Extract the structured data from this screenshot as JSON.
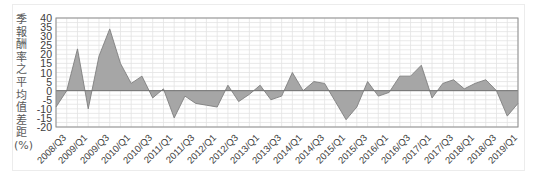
{
  "chart_data": {
    "type": "area",
    "title": "",
    "xlabel": "",
    "ylabel": "季報酬率之平均值 差距(%)",
    "ylim": [
      -20,
      40
    ],
    "yticks": [
      40,
      35,
      30,
      25,
      20,
      15,
      10,
      5,
      0,
      -5,
      -10,
      -15,
      -20
    ],
    "grid": true,
    "legend": null,
    "x_tick_labels": [
      "2008/Q3",
      "2009/Q1",
      "2009/Q3",
      "2010/Q1",
      "2010/Q3",
      "2011/Q1",
      "2011/Q3",
      "2012/Q1",
      "2012/Q3",
      "2013/Q1",
      "2013/Q3",
      "2014/Q1",
      "2014/Q3",
      "2015/Q1",
      "2015/Q3",
      "2016/Q1",
      "2016/Q3",
      "2017/Q1",
      "2017/Q3",
      "2018/Q1",
      "2018/Q3",
      "2019/Q1"
    ],
    "categories": [
      "2008/Q3",
      "2008/Q4",
      "2009/Q1",
      "2009/Q2",
      "2009/Q3",
      "2009/Q4",
      "2010/Q1",
      "2010/Q2",
      "2010/Q3",
      "2010/Q4",
      "2011/Q1",
      "2011/Q2",
      "2011/Q3",
      "2011/Q4",
      "2012/Q1",
      "2012/Q2",
      "2012/Q3",
      "2012/Q4",
      "2013/Q1",
      "2013/Q2",
      "2013/Q3",
      "2013/Q4",
      "2014/Q1",
      "2014/Q2",
      "2014/Q3",
      "2014/Q4",
      "2015/Q1",
      "2015/Q2",
      "2015/Q3",
      "2015/Q4",
      "2016/Q1",
      "2016/Q2",
      "2016/Q3",
      "2016/Q4",
      "2017/Q1",
      "2017/Q2",
      "2017/Q3",
      "2017/Q4",
      "2018/Q1",
      "2018/Q2",
      "2018/Q3",
      "2018/Q4",
      "2019/Q1",
      "2019/Q2"
    ],
    "values": [
      -9,
      0,
      23,
      -10,
      19,
      34,
      15,
      4,
      8,
      -4,
      1,
      -15,
      -3,
      -7,
      -8,
      -9,
      3,
      -6,
      -2,
      3,
      -5,
      -3,
      10,
      0,
      5,
      4,
      -6,
      -16,
      -9,
      5,
      -3,
      -1,
      8,
      8,
      14,
      -4,
      4,
      6,
      1,
      4,
      6,
      0,
      -14,
      -7
    ],
    "colors": {
      "fill": "#a6a6a6",
      "line": "#7f7f7f",
      "grid": "#e3e3e3",
      "axis": "#8c8c8c"
    }
  }
}
